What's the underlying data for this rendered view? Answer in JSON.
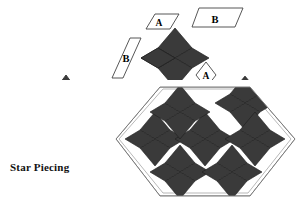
{
  "figure": {
    "background_color": "#ffffff",
    "dark_fill": "#3a3a3a",
    "light_fill": "#ffffff",
    "outline_color": "#6b6b6b",
    "piece_outline_color": "#000000",
    "letter_color_on_dark": "#ffffff",
    "letter_color_on_light": "#000000"
  },
  "left_panel": {
    "caption": "Star Piecing",
    "upper_pieces": [
      {
        "label": "A",
        "role": "left-rhombus"
      },
      {
        "label": "A",
        "role": "top-rhombus"
      },
      {
        "label": "A",
        "role": "right-rhombus"
      }
    ],
    "lower_unit": {
      "label": "",
      "role": "joined-half-star",
      "piece_count": 3
    }
  },
  "right_panel": {
    "templates": [
      {
        "name": "A",
        "shape": "rhombus",
        "position": "top-left"
      },
      {
        "name": "B",
        "shape": "trapezoid",
        "position": "top-right"
      },
      {
        "name": "B",
        "shape": "slanted-parallelogram",
        "position": "left"
      },
      {
        "name": "A",
        "shape": "rhombus",
        "position": "middle"
      }
    ],
    "loose_star": {
      "points": 6,
      "piece_count": 6
    },
    "hexagon_block": {
      "shape": "hexagon",
      "star_count": 7,
      "points_per_star": 6
    }
  }
}
